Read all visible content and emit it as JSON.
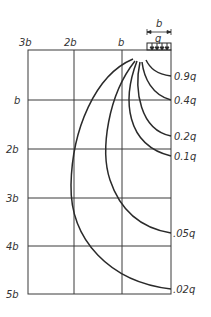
{
  "diagram": {
    "load": {
      "width_label": "b",
      "intensity_label": "q"
    },
    "axes": {
      "top_labels": [
        "3b",
        "2b",
        "b"
      ],
      "left_labels": [
        "b",
        "2b",
        "3b",
        "4b",
        "5b"
      ]
    },
    "isobars": [
      {
        "label": "0.9q"
      },
      {
        "label": "0.4q"
      },
      {
        "label": "0.2q"
      },
      {
        "label": "0.1q"
      },
      {
        "label": ".05q"
      },
      {
        "label": ".02q"
      }
    ],
    "colors": {
      "line": "#2a2a2a",
      "grid": "#3a3a3a",
      "text": "#333333",
      "background": "#ffffff"
    }
  }
}
